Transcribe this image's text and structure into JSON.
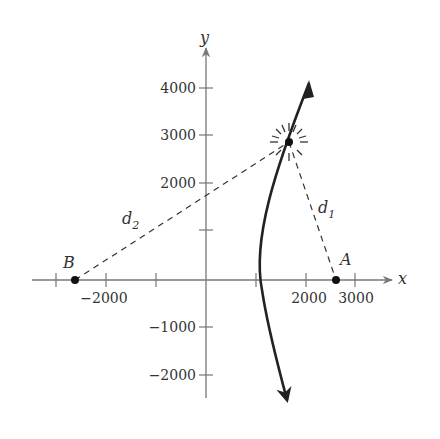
{
  "diagram": {
    "axes": {
      "x_label": "x",
      "y_label": "y",
      "x_ticks": [
        {
          "value": -3000,
          "label": ""
        },
        {
          "value": -2000,
          "label": "−2000"
        },
        {
          "value": -1000,
          "label": ""
        },
        {
          "value": 1000,
          "label": ""
        },
        {
          "value": 2000,
          "label": "2000"
        },
        {
          "value": 3000,
          "label": "3000"
        }
      ],
      "y_ticks": [
        {
          "value": 4000,
          "label": "4000"
        },
        {
          "value": 3000,
          "label": "3000"
        },
        {
          "value": 2000,
          "label": "2000"
        },
        {
          "value": 1000,
          "label": ""
        },
        {
          "value": -1000,
          "label": "−1000"
        },
        {
          "value": -2000,
          "label": "−2000"
        }
      ]
    },
    "points": [
      {
        "name": "A",
        "x": 2600,
        "y": 0
      },
      {
        "name": "B",
        "x": -2600,
        "y": 0
      },
      {
        "name": "explosion",
        "x": 1700,
        "y": 2900
      }
    ],
    "distance_labels": {
      "d1": "d",
      "d1_sub": "1",
      "d2": "d",
      "d2_sub": "2"
    },
    "curve": "hyperbola branch (right)",
    "colors": {
      "ink": "#222222",
      "axis": "#777777"
    }
  }
}
